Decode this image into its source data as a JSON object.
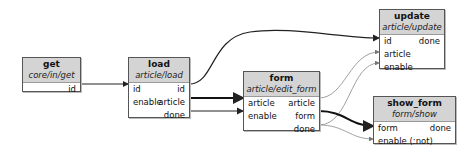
{
  "nodes": {
    "get": {
      "name": "get",
      "type": "core/in/get",
      "inputs": [],
      "outputs": [
        "id"
      ]
    },
    "load": {
      "name": "load",
      "type": "article/load",
      "inputs": [
        "id",
        "enable"
      ],
      "outputs": [
        "id",
        "article",
        "done"
      ]
    },
    "form": {
      "name": "form",
      "type": "article/edit_form",
      "inputs": [
        "article",
        "enable"
      ],
      "outputs": [
        "article",
        "form",
        "done"
      ]
    },
    "update": {
      "name": "update",
      "type": "article/update",
      "inputs": [
        "id",
        "article",
        "enable"
      ],
      "outputs": [
        "done"
      ]
    },
    "show_form": {
      "name": "show_form",
      "type": "form/show",
      "inputs": [
        "form",
        "enable (:not)"
      ],
      "outputs": [
        "done"
      ]
    }
  },
  "edges": [
    {
      "from": "get.id",
      "to": "load.id",
      "style": "normal"
    },
    {
      "from": "load.id",
      "to": "update.id",
      "style": "normal"
    },
    {
      "from": "load.article",
      "to": "form.article",
      "style": "bold"
    },
    {
      "from": "load.done",
      "to": "form.enable",
      "style": "normal"
    },
    {
      "from": "form.article",
      "to": "update.article",
      "style": "thin"
    },
    {
      "from": "form.done",
      "to": "update.enable",
      "style": "thin"
    },
    {
      "from": "form.form",
      "to": "show_form.form",
      "style": "bold"
    },
    {
      "from": "form.done",
      "to": "show_form.enable",
      "style": "thin"
    }
  ],
  "colors": {
    "header": "#d4d4d4",
    "border": "#555555",
    "edge": "#222222",
    "thin_edge": "#888888"
  }
}
